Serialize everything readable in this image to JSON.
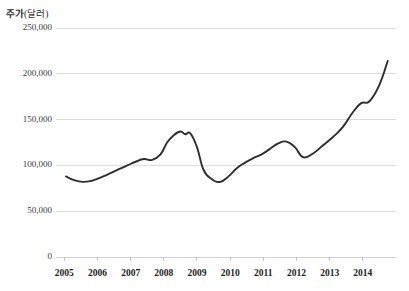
{
  "chart_data": {
    "type": "line",
    "title": "주가(달러)",
    "title_main": "주가",
    "title_unit": "(달러)",
    "xlabel": "",
    "ylabel": "주가(달러)",
    "ylim": [
      0,
      250000
    ],
    "xlim": [
      2004.75,
      2015.0
    ],
    "grid": true,
    "legend": "none",
    "yticks": [
      0,
      50000,
      100000,
      150000,
      200000,
      250000
    ],
    "ytick_labels": [
      "0",
      "50,000",
      "100,000",
      "150,000",
      "200,000",
      "250,000"
    ],
    "xticks": [
      2005,
      2006,
      2007,
      2008,
      2009,
      2010,
      2011,
      2012,
      2013,
      2014
    ],
    "xtick_labels": [
      "2005",
      "2006",
      "2007",
      "2008",
      "2009",
      "2010",
      "2011",
      "2012",
      "2013",
      "2014"
    ],
    "line_color": "#2e2e2e",
    "grid_color": "#d8d8d8",
    "series": [
      {
        "name": "주가",
        "x": [
          2005.05,
          2005.3,
          2005.55,
          2005.8,
          2006.05,
          2006.3,
          2006.6,
          2006.9,
          2007.15,
          2007.4,
          2007.65,
          2007.9,
          2008.1,
          2008.3,
          2008.5,
          2008.65,
          2008.8,
          2009.0,
          2009.2,
          2009.45,
          2009.7,
          2009.95,
          2010.2,
          2010.45,
          2010.7,
          2010.95,
          2011.2,
          2011.45,
          2011.7,
          2011.95,
          2012.2,
          2012.5,
          2012.8,
          2013.1,
          2013.4,
          2013.7,
          2013.95,
          2014.2,
          2014.5,
          2014.75
        ],
        "values": [
          88000,
          84000,
          82000,
          83000,
          86000,
          90000,
          95000,
          100000,
          104000,
          107000,
          106000,
          112000,
          125000,
          133000,
          137000,
          134000,
          135000,
          120000,
          95000,
          85000,
          82000,
          88000,
          97000,
          103000,
          108000,
          112000,
          118000,
          124000,
          126000,
          120000,
          109000,
          113000,
          122000,
          131000,
          142000,
          158000,
          168000,
          170000,
          188000,
          214000
        ]
      }
    ],
    "annotations": []
  }
}
